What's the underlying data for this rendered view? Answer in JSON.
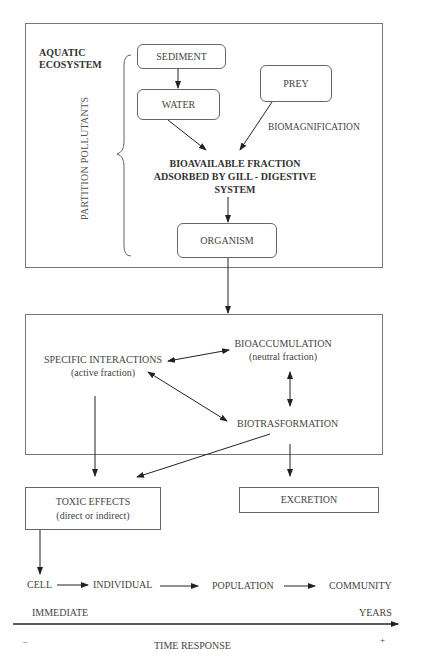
{
  "aquatic_panel": {
    "title_line1": "AQUATIC",
    "title_line2": "ECOSYSTEM",
    "brace_label": "PARTITION POLLUTANTS",
    "nodes": {
      "sediment": "SEDIMENT",
      "water": "WATER",
      "prey": "PREY",
      "organism": "ORGANISM"
    },
    "biomagnification_label": "BIOMAGNIFICATION",
    "bioavailable_line1": "BIOAVAILABLE FRACTION",
    "bioavailable_line2": "ADSORBED BY GILL - DIGESTIVE",
    "bioavailable_line3": "SYSTEM"
  },
  "organism_panel": {
    "specific_interactions": "SPECIFIC INTERACTIONS",
    "specific_interactions_sub": "(active fraction)",
    "bioaccumulation": "BIOACCUMULATION",
    "bioaccumulation_sub": "(neutral fraction)",
    "biotransformation": "BIOTRASFORMATION"
  },
  "outcomes": {
    "toxic_effects": "TOXIC EFFECTS",
    "toxic_effects_sub": "(direct or indirect)",
    "excretion": "EXCRETION"
  },
  "levels": [
    "CELL",
    "INDIVIDUAL",
    "POPULATION",
    "COMMUNITY"
  ],
  "time_axis": {
    "start_label": "IMMEDIATE",
    "end_label": "YEARS",
    "minus": "–",
    "plus": "+",
    "axis_title": "TIME RESPONSE"
  },
  "colors": {
    "line": "#222222",
    "border": "#777777",
    "text": "#444444"
  }
}
